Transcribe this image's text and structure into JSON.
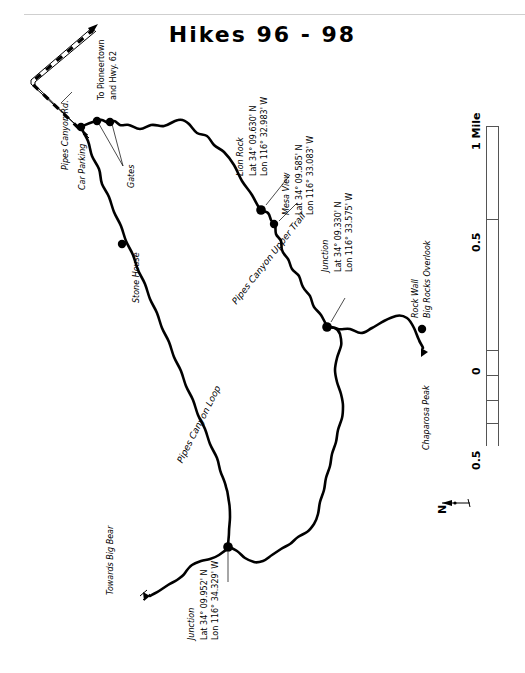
{
  "page": {
    "title": "Hikes 96 - 98",
    "width": 525,
    "height": 673,
    "background": "#ffffff",
    "ink": "#000000"
  },
  "map": {
    "orientation": "rotated-90-labels",
    "roads": [
      {
        "name": "pipes-canyon-rd",
        "label": "Pipes Canyon Rd.",
        "style": "dashed-double-line"
      }
    ],
    "direction_labels": [
      {
        "name": "to-pioneertown",
        "line1": "To Pioneertown",
        "line2": "and Hwy. 62"
      },
      {
        "name": "towards-big-bear",
        "text": "Towards Big Bear"
      }
    ],
    "trail_labels": [
      {
        "name": "pipes-canyon-upper-trail",
        "text": "Pipes Canyon Upper Trail"
      },
      {
        "name": "pipes-canyon-loop",
        "text": "Pipes Canyon Loop"
      }
    ],
    "features": [
      {
        "name": "car-parking",
        "label": "Car Parking",
        "marker": "dot"
      },
      {
        "name": "gates",
        "label": "Gates",
        "marker": "dot-pair"
      },
      {
        "name": "stone-house",
        "label": "Stone House",
        "marker": "dot"
      },
      {
        "name": "chaparosa-peak",
        "label": "Chaparosa Peak",
        "marker": "triangle"
      }
    ],
    "waypoints": [
      {
        "name": "lion-rock",
        "label": "Lion Rock",
        "lat": "Lat 34° 09.630' N",
        "lon": "Lon 116° 32.983' W",
        "marker": "dot"
      },
      {
        "name": "mesa-view",
        "label": "Mesa View",
        "lat": "Lat 34° 09.585' N",
        "lon": "Lon 116° 33.083' W",
        "marker": "dot"
      },
      {
        "name": "junction-east",
        "label": "Junction",
        "lat": "Lat 34° 09.330' N",
        "lon": "Lon 116° 33.575' W",
        "marker": "dot"
      },
      {
        "name": "junction-south",
        "label": "Junction",
        "lat": "Lat 34° 09.952' N",
        "lon": "Lon 116° 34.329' W",
        "marker": "dot"
      },
      {
        "name": "rock-wall",
        "label_line1": "Rock Wall",
        "label_line2": "Big Rocks Overlook",
        "marker": "dot"
      }
    ],
    "scale": {
      "name": "scale-bar",
      "unit_label": "1 Mile",
      "ticks": [
        "1 Mile",
        "0.5",
        "0",
        "0.5"
      ],
      "orientation": "vertical"
    },
    "compass": {
      "name": "north-arrow",
      "label": "N"
    }
  }
}
